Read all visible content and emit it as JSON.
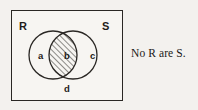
{
  "figure": {
    "type": "euler-venn-diagram",
    "universe_label": "",
    "caption": "No R are S.",
    "sets": [
      {
        "id": "R",
        "label": "R",
        "side": "left"
      },
      {
        "id": "S",
        "label": "S",
        "side": "right"
      }
    ],
    "regions": [
      {
        "id": "a",
        "label": "a",
        "description": "R only",
        "shaded": false
      },
      {
        "id": "b",
        "label": "b",
        "description": "R and S overlap",
        "shaded": true
      },
      {
        "id": "c",
        "label": "c",
        "description": "S only",
        "shaded": false
      },
      {
        "id": "d",
        "label": "d",
        "description": "outside both sets",
        "shaded": false
      }
    ],
    "shading": {
      "region": "b",
      "style": "diagonal-hatch",
      "direction": "lower-left-to-upper-right"
    },
    "colors": {
      "background": "#f3f1ee",
      "panel": "#f7f5f2",
      "stroke": "#2a2724",
      "text": "#1f1c1a",
      "hatch": "#2a2724"
    }
  }
}
